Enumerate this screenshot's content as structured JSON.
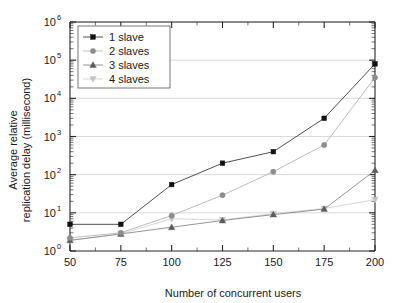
{
  "chart_data": {
    "type": "line",
    "title": "",
    "xlabel": "Number of concurrent users",
    "ylabel": "Average relative replication delay (millisecond)",
    "ylabel_line1": "Average relative",
    "ylabel_line2": "replication delay (millisecond)",
    "x": [
      50,
      75,
      100,
      125,
      150,
      175,
      200
    ],
    "xticklabels": [
      "50",
      "75",
      "100",
      "125",
      "150",
      "175",
      "200"
    ],
    "xlim": [
      50,
      200
    ],
    "yscale": "log",
    "ylim": [
      1,
      1000000
    ],
    "yticklabels": [
      "10",
      "10",
      "10",
      "10",
      "10",
      "10",
      "10"
    ],
    "yticks_exponents": [
      "0",
      "1",
      "2",
      "3",
      "4",
      "5",
      "6"
    ],
    "yticks": [
      1,
      10,
      100,
      1000,
      10000,
      100000,
      1000000
    ],
    "grid": true,
    "grid_axis": "y",
    "legend_position": "upper left",
    "series": [
      {
        "name": "1 slave",
        "marker": "square",
        "color": "#111111",
        "line_color": "#3c3c3c",
        "values": [
          5,
          5,
          55,
          200,
          400,
          3000,
          80000
        ]
      },
      {
        "name": "2 slaves",
        "marker": "circle",
        "color": "#8d8d8d",
        "line_color": "#b4b4b4",
        "values": [
          2.2,
          3,
          8.5,
          29,
          120,
          600,
          35000
        ]
      },
      {
        "name": "3 slaves",
        "marker": "triangle-up",
        "color": "#5c5c5c",
        "line_color": "#8a8a8a",
        "values": [
          1.9,
          2.8,
          4.2,
          6.3,
          9,
          12.5,
          130
        ]
      },
      {
        "name": "4 slaves",
        "marker": "triangle-down",
        "color": "#c2c2c2",
        "line_color": "#d2d2d2",
        "values": [
          1.9,
          2.8,
          7,
          6.5,
          9.5,
          13,
          22
        ]
      }
    ]
  },
  "legend": {
    "entries": [
      "1 slave",
      "2 slaves",
      "3 slaves",
      "4 slaves"
    ]
  },
  "colors": {
    "axis": "#262626",
    "grid": "#c9c9c9",
    "background": "#ffffff"
  }
}
